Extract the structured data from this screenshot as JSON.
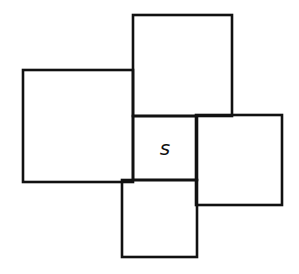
{
  "diagram": {
    "stroke_color": "#111111",
    "background": "#ffffff",
    "center_label": "s",
    "shapes": [
      {
        "name": "top-square",
        "x": 133,
        "y": 15,
        "w": 99,
        "h": 101
      },
      {
        "name": "left-rectangle",
        "x": 23,
        "y": 70,
        "w": 110,
        "h": 112
      },
      {
        "name": "right-rectangle",
        "x": 196,
        "y": 115,
        "w": 86,
        "h": 90
      },
      {
        "name": "bottom-square",
        "x": 122,
        "y": 180,
        "w": 75,
        "h": 77
      },
      {
        "name": "center-square-s",
        "x": 133,
        "y": 116,
        "w": 64,
        "h": 64
      }
    ]
  }
}
